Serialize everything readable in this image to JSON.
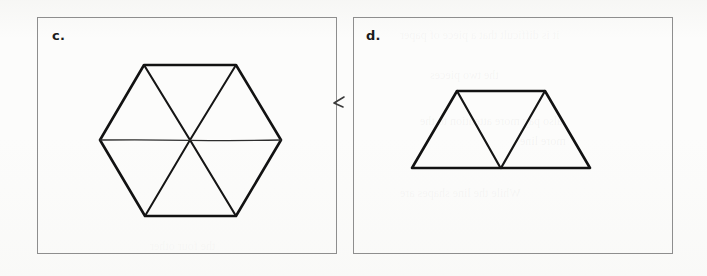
{
  "page": {
    "background_color": "#fcfcfb",
    "ink_color": "#121212",
    "border_color": "#8e8e8e",
    "width": 707,
    "height": 276
  },
  "ghost_text": {
    "note": "faint bleed-through text from reverse side of page, illegible",
    "lines": [
      {
        "text": "it is difficult that a piece of paper",
        "x": 400,
        "y": 34,
        "size": 12
      },
      {
        "text": "the two pieces",
        "x": 430,
        "y": 74,
        "size": 12
      },
      {
        "text": "also pay more attention to the",
        "x": 420,
        "y": 120,
        "size": 12
      },
      {
        "text": "While the line shapes are",
        "x": 400,
        "y": 192,
        "size": 12
      },
      {
        "text": "the four other",
        "x": 150,
        "y": 245,
        "size": 12
      },
      {
        "text": "more line",
        "x": 520,
        "y": 140,
        "size": 12
      }
    ]
  },
  "panels": [
    {
      "id": "panel-c",
      "label": "c.",
      "label_name": "panel-label-c",
      "frame": {
        "x": 37,
        "y": 17,
        "width": 300,
        "height": 237
      },
      "figure": {
        "name": "hexagon-six-triangles",
        "shape": "regular-hexagon",
        "description": "Regular hexagon divided into six triangles by three long diagonals meeting at the centre",
        "vertices": [
          {
            "label": "top-left",
            "x": 144,
            "y": 65
          },
          {
            "label": "top-right",
            "x": 236,
            "y": 65
          },
          {
            "label": "right",
            "x": 281,
            "y": 140
          },
          {
            "label": "bottom-right",
            "x": 236,
            "y": 216
          },
          {
            "label": "bottom-left",
            "x": 145,
            "y": 216
          },
          {
            "label": "left",
            "x": 100,
            "y": 140
          }
        ],
        "center": {
          "x": 190,
          "y": 140
        },
        "diagonals": [
          {
            "from": "top-left",
            "to": "bottom-right",
            "weight": "heavy"
          },
          {
            "from": "top-right",
            "to": "bottom-left",
            "weight": "heavy"
          },
          {
            "from": "left",
            "to": "right",
            "weight": "light"
          }
        ],
        "triangle_count": 6,
        "stroke_width_outline": 2.6,
        "stroke_width_diagonal_heavy": 2.2,
        "stroke_width_diagonal_light": 1.3
      }
    },
    {
      "id": "panel-d",
      "label": "d.",
      "label_name": "panel-label-d",
      "frame": {
        "x": 353,
        "y": 17,
        "width": 320,
        "height": 237
      },
      "figure": {
        "name": "trapezoid-three-triangles",
        "shape": "isosceles-trapezoid",
        "description": "Isosceles trapezoid divided into three triangles by two lines forming a V from the top corners to the midpoint of the base",
        "vertices": [
          {
            "label": "top-left",
            "x": 457,
            "y": 91
          },
          {
            "label": "top-right",
            "x": 545,
            "y": 91
          },
          {
            "label": "bottom-right",
            "x": 590,
            "y": 168
          },
          {
            "label": "bottom-left",
            "x": 412,
            "y": 168
          }
        ],
        "base_midpoint": {
          "x": 501,
          "y": 168
        },
        "diagonals": [
          {
            "from": "top-left",
            "to": "base-midpoint",
            "weight": "heavy"
          },
          {
            "from": "top-right",
            "to": "base-midpoint",
            "weight": "heavy"
          }
        ],
        "triangle_count": 3,
        "stroke_width_outline": 2.6,
        "stroke_width_diagonal_heavy": 2.2
      }
    }
  ],
  "annotations": [
    {
      "name": "check-mark",
      "kind": "hand-drawn-pen-mark",
      "description": "small hand-drawn check / caret mark in the margin between the two panels",
      "x": 337,
      "y": 103
    }
  ]
}
